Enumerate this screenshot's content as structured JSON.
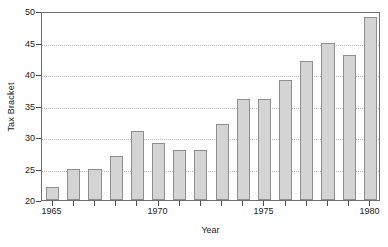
{
  "chart_data": {
    "type": "bar",
    "title": "",
    "xlabel": "Year",
    "ylabel": "Tax Bracket",
    "categories": [
      1965,
      1966,
      1967,
      1968,
      1969,
      1970,
      1971,
      1972,
      1973,
      1974,
      1975,
      1976,
      1977,
      1978,
      1979,
      1980
    ],
    "values": [
      22,
      25,
      25,
      27,
      31,
      29,
      28,
      28,
      32,
      36,
      36,
      39,
      42,
      45,
      43,
      49
    ],
    "series": [
      {
        "name": "Tax Bracket",
        "values": [
          22,
          25,
          25,
          27,
          31,
          29,
          28,
          28,
          32,
          36,
          36,
          39,
          42,
          45,
          43,
          49
        ]
      }
    ],
    "ylim": [
      20,
      50
    ],
    "xlim": [
      1964.5,
      1980.5
    ],
    "ytick_labels": [
      "20",
      "25",
      "30",
      "35",
      "40",
      "45",
      "50"
    ],
    "ytick_values": [
      20,
      25,
      30,
      35,
      40,
      45,
      50
    ],
    "xtick_labels": [
      "1965",
      "1970",
      "1975",
      "1980"
    ],
    "xtick_values": [
      1965,
      1970,
      1975,
      1980
    ],
    "grid": "horizontal-dotted",
    "legend": "none",
    "bar_fill_color": "#d4d4d4",
    "bar_border_color": "#8e8e8e",
    "grid_color": "#b9b9b9",
    "axis_color": "#6e6e6e",
    "background_color": "#ffffff"
  }
}
